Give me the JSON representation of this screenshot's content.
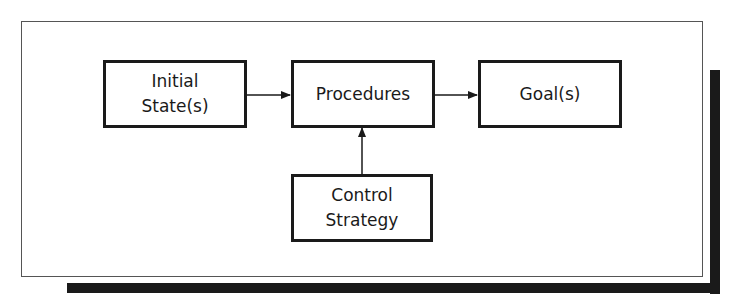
{
  "diagram": {
    "type": "flowchart",
    "nodes": [
      {
        "id": "initial",
        "lines": [
          "Initial",
          "State(s)"
        ]
      },
      {
        "id": "procedures",
        "lines": [
          "Procedures"
        ]
      },
      {
        "id": "goal",
        "lines": [
          "Goal(s)"
        ]
      },
      {
        "id": "control",
        "lines": [
          "Control",
          "Strategy"
        ]
      }
    ],
    "edges": [
      {
        "from": "initial",
        "to": "procedures"
      },
      {
        "from": "procedures",
        "to": "goal"
      },
      {
        "from": "control",
        "to": "procedures"
      }
    ],
    "colors": {
      "line": "#1a1a1a",
      "background": "#ffffff",
      "shadow": "#1a1a1a"
    }
  }
}
